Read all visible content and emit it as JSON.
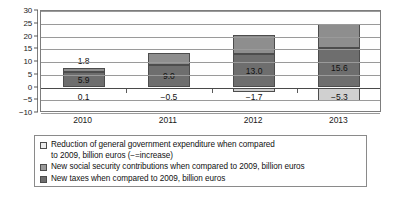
{
  "chart_data": {
    "type": "bar",
    "subtype": "stacked-bar-with-negative",
    "title": "",
    "xlabel": "",
    "ylabel": "",
    "ylim": [
      -10,
      30
    ],
    "yticks": [
      30,
      25,
      20,
      15,
      10,
      5,
      0,
      -5,
      -10
    ],
    "ytick_labels": [
      "30",
      "25",
      "20",
      "15",
      "10",
      "5",
      "0",
      "−5",
      "−10"
    ],
    "grid": true,
    "legend_position": "below",
    "categories": [
      "2010",
      "2011",
      "2012",
      "2013"
    ],
    "series": [
      {
        "name": "Reduction of general government expenditure when compared to 2009, billion euros (−=increase)",
        "short_name": "expenditure",
        "color": "#d0d0d0",
        "swatch_color": "#ececec",
        "values": [
          0.1,
          -0.5,
          -1.7,
          -5.3
        ],
        "labels": [
          "0.1",
          "−0.5",
          "−1.7",
          "−5.3"
        ]
      },
      {
        "name": "New social security contributions when compared to 2009, billion euros",
        "short_name": "social",
        "color": "#8e8e8e",
        "swatch_color": "#9a9a9a",
        "values": [
          1.8,
          4.6,
          7.4,
          9.2
        ],
        "labels": [
          "1.8",
          "4.6",
          "7.4",
          "9.2"
        ]
      },
      {
        "name": "New taxes when compared to 2009, billion euros",
        "short_name": "taxes",
        "color": "#6e6e6e",
        "swatch_color": "#6e6e6e",
        "values": [
          5.9,
          9.0,
          13.0,
          15.6
        ],
        "labels": [
          "5.9",
          "9.0",
          "13.0",
          "15.6"
        ]
      }
    ]
  },
  "legend": {
    "items": [
      {
        "line1": "Reduction of general government expenditure when compared",
        "line2": "to 2009, billion euros (−=increase)",
        "swatch": "expenditure"
      },
      {
        "line1": "New social security contributions when compared to 2009, billion euros",
        "line2": "",
        "swatch": "social"
      },
      {
        "line1": "New taxes when compared to 2009, billion euros",
        "line2": "",
        "swatch": "taxes"
      }
    ]
  }
}
